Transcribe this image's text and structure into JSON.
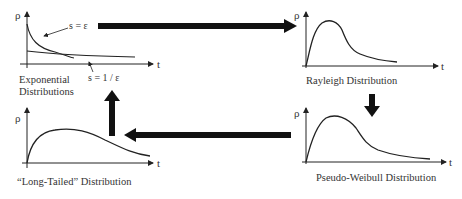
{
  "diagram": {
    "panels": [
      {
        "id": "exponential",
        "label_line1": "Exponential",
        "label_line2": "Distributions",
        "y_axis": "ρ",
        "x_axis": "t",
        "annotations": [
          "s = ε",
          "s = 1 / ε"
        ]
      },
      {
        "id": "rayleigh",
        "label": "Rayleigh Distribution",
        "y_axis": "ρ",
        "x_axis": "t"
      },
      {
        "id": "pseudo-weibull",
        "label": "Pseudo-Weibull Distribution",
        "y_axis": "ρ",
        "x_axis": "t"
      },
      {
        "id": "long-tailed",
        "label": "“Long-Tailed” Distribution",
        "y_axis": "ρ",
        "x_axis": "t"
      }
    ],
    "flow": [
      {
        "from": "exponential",
        "to": "rayleigh",
        "direction": "right"
      },
      {
        "from": "rayleigh",
        "to": "pseudo-weibull",
        "direction": "down"
      },
      {
        "from": "pseudo-weibull",
        "to": "long-tailed",
        "direction": "left"
      },
      {
        "from": "long-tailed",
        "to": "exponential",
        "direction": "up"
      }
    ],
    "colors": {
      "line": "#222222",
      "arrow": "#111111",
      "background": "#ffffff"
    }
  }
}
